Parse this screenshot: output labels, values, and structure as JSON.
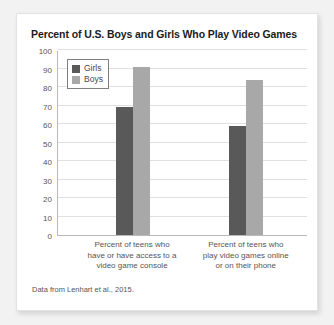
{
  "chart_data": {
    "type": "bar",
    "title": "Percent of U.S. Boys and Girls Who Play Video Games",
    "xlabel": "",
    "ylabel": "",
    "ylim": [
      0,
      100
    ],
    "ytick_step": 10,
    "yticks": [
      100,
      90,
      80,
      70,
      60,
      50,
      40,
      30,
      20,
      10,
      0
    ],
    "grid": true,
    "legend_position": "top-left",
    "categories": [
      "Percent of teens who have or have access to a video game console",
      "Percent of teens who play video games online or on their phone"
    ],
    "series": [
      {
        "name": "Girls",
        "color": "#595959",
        "values": [
          69,
          59
        ]
      },
      {
        "name": "Boys",
        "color": "#a8a8a8",
        "values": [
          91,
          84
        ]
      }
    ],
    "source_note": "Data from Lenhart et al., 2015."
  },
  "category_lines": [
    [
      "Percent of teens who",
      "have or have access to a",
      "video game console"
    ],
    [
      "Percent of teens who",
      "play video games online",
      "or on their phone"
    ]
  ]
}
